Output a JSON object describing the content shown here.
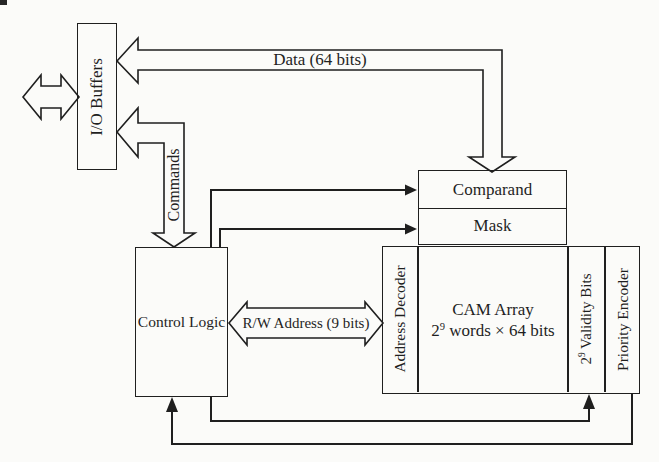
{
  "colors": {
    "ink": "#1f1f1f",
    "paper": "#fbfbf9"
  },
  "labels": {
    "io_buffers": "I/O Buffers",
    "data_bus": "Data (64 bits)",
    "commands": "Commands",
    "control_logic": "Control Logic",
    "comparand": "Comparand",
    "mask": "Mask",
    "rw_address": "R/W Address (9 bits)",
    "address_decoder": "Address Decoder",
    "cam_array_line1": "CAM Array",
    "cam_array_line2": {
      "base": "2",
      "sup": "9",
      "rest": " words × 64 bits"
    },
    "validity_bits": {
      "base": "2",
      "sup": "9",
      "rest": " Validity Bits"
    },
    "priority_encoder": "Priority Encoder"
  },
  "arrows": {
    "external_io": "bidirectional-horizontal",
    "data_bus": "bidirectional-elbow",
    "commands": "bidirectional-elbow",
    "rw_address": "bidirectional-horizontal",
    "control_to_comparand": "right",
    "control_to_mask": "right",
    "control_to_validity_bits": "up",
    "priority_encoder_to_control": "up"
  }
}
